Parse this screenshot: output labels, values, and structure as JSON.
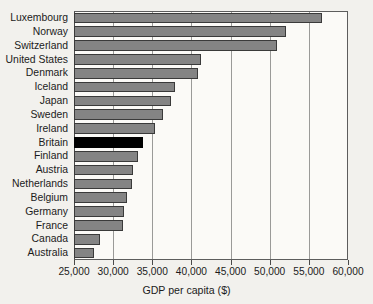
{
  "chart_data": {
    "type": "bar",
    "orientation": "horizontal",
    "title": "",
    "xlabel": "GDP per capita ($)",
    "ylabel": "",
    "xlim": [
      25000,
      60000
    ],
    "xticks": [
      25000,
      30000,
      35000,
      40000,
      45000,
      50000,
      55000,
      60000
    ],
    "xtick_labels": [
      "25,000",
      "30,000",
      "35,000",
      "40,000",
      "45,000",
      "50,000",
      "55,000",
      "60,000"
    ],
    "grid": "vertical",
    "legend": "none",
    "bar_color": "#848484",
    "highlight_color": "#000000",
    "highlight_category": "Britain",
    "categories": [
      "Luxembourg",
      "Norway",
      "Switzerland",
      "United States",
      "Denmark",
      "Iceland",
      "Japan",
      "Sweden",
      "Ireland",
      "Britain",
      "Finland",
      "Austria",
      "Netherlands",
      "Belgium",
      "Germany",
      "France",
      "Canada",
      "Australia"
    ],
    "values": [
      56700,
      52100,
      50900,
      41200,
      40800,
      37900,
      37400,
      36400,
      35400,
      33800,
      33200,
      32500,
      32400,
      31800,
      31400,
      31200,
      28300,
      27600
    ]
  },
  "axis": {
    "x_title": "GDP per capita ($)"
  }
}
